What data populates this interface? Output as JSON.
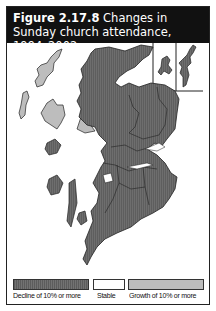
{
  "figure": {
    "number": "Figure 2.17.8",
    "caption": "Changes in Sunday church attendance, 1994–2002"
  },
  "map": {
    "region": "Scotland",
    "inset": "Orkney and Shetland",
    "colors": {
      "decline": "#6a6a6a",
      "stable": "#ffffff",
      "growth": "#bdbdbd",
      "border": "#222222"
    }
  },
  "legend": {
    "items": [
      {
        "label": "Decline of 10% or more",
        "color": "#6a6a6a"
      },
      {
        "label": "Stable",
        "color": "#ffffff"
      },
      {
        "label": "Growth of 10% or more",
        "color": "#bdbdbd"
      }
    ]
  }
}
